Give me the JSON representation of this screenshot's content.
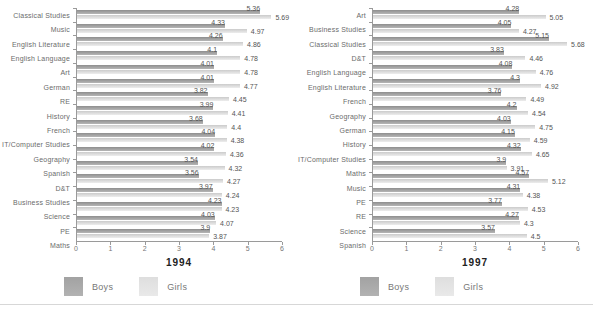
{
  "colors": {
    "boys_bar": "#a2a2a2",
    "girls_bar": "#e3e3e3",
    "axis": "#9a9a9a",
    "category_text": "#6b6b6b",
    "value_text": "#555555",
    "title_text": "#222222"
  },
  "legend": {
    "boys_label": "Boys",
    "girls_label": "Girls"
  },
  "chart_data": [
    {
      "type": "bar",
      "orientation": "horizontal",
      "title": "1994",
      "xlabel": "",
      "ylabel": "",
      "xlim": [
        0,
        6
      ],
      "xticks": [
        0,
        1,
        2,
        3,
        4,
        5,
        6
      ],
      "grid": false,
      "legend_position": "bottom",
      "categories": [
        "Classical Studies",
        "Music",
        "English Literature",
        "English Language",
        "Art",
        "German",
        "RE",
        "History",
        "French",
        "IT/Computer Studies",
        "Geography",
        "Spanish",
        "D&T",
        "Business Studies",
        "Science",
        "PE",
        "Maths"
      ],
      "series": [
        {
          "name": "Boys",
          "values": [
            5.36,
            4.33,
            4.26,
            4.1,
            4.01,
            4.01,
            3.82,
            3.99,
            3.68,
            4.04,
            4.02,
            3.54,
            3.56,
            3.97,
            4.23,
            4.03,
            3.9
          ]
        },
        {
          "name": "Girls",
          "values": [
            5.69,
            4.97,
            4.86,
            4.78,
            4.78,
            4.77,
            4.45,
            4.41,
            4.4,
            4.38,
            4.36,
            4.32,
            4.27,
            4.24,
            4.23,
            4.07,
            3.87
          ]
        }
      ]
    },
    {
      "type": "bar",
      "orientation": "horizontal",
      "title": "1997",
      "xlabel": "",
      "ylabel": "",
      "xlim": [
        0,
        6
      ],
      "xticks": [
        0,
        1,
        2,
        3,
        4,
        5,
        6
      ],
      "grid": false,
      "legend_position": "bottom",
      "categories": [
        "Art",
        "Business Studies",
        "Classical Studies",
        "D&T",
        "English Language",
        "English Literature",
        "French",
        "Geography",
        "German",
        "History",
        "IT/Computer Studies",
        "Maths",
        "Music",
        "PE",
        "RE",
        "Science",
        "Spanish"
      ],
      "series": [
        {
          "name": "Boys",
          "values": [
            4.28,
            4.05,
            5.15,
            3.83,
            4.08,
            4.3,
            3.76,
            4.2,
            4.03,
            4.15,
            4.32,
            3.9,
            4.57,
            4.31,
            3.77,
            4.27,
            3.57
          ]
        },
        {
          "name": "Girls",
          "values": [
            5.05,
            4.27,
            5.68,
            4.46,
            4.76,
            4.92,
            4.49,
            4.54,
            4.75,
            4.59,
            4.65,
            3.91,
            5.12,
            4.38,
            4.53,
            4.3,
            4.5
          ]
        }
      ]
    }
  ]
}
